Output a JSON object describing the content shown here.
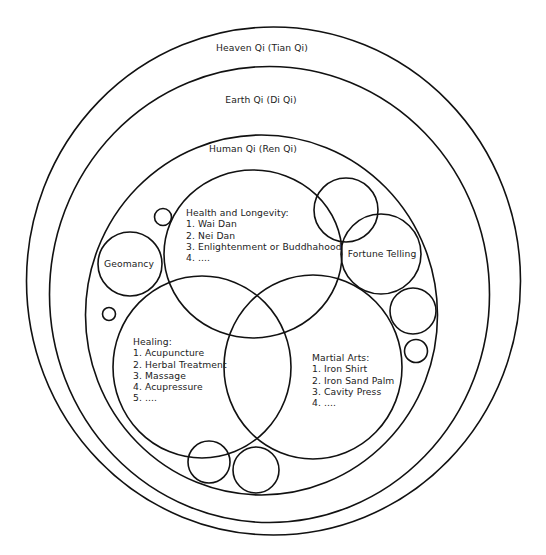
{
  "diagram": {
    "type": "nested-venn",
    "levels": {
      "heaven": "Heaven Qi (Tian Qi)",
      "earth": "Earth Qi (Di Qi)",
      "human": "Human Qi (Ren Qi)"
    },
    "domains": {
      "health": {
        "title": "Health and Longevity:",
        "items": [
          "1. Wai Dan",
          "2. Nei Dan",
          "3. Enlightenment or Buddhahood",
          "4. ...."
        ]
      },
      "healing": {
        "title": "Healing:",
        "items": [
          "1. Acupuncture",
          "2. Herbal Treatment",
          "3. Massage",
          "4. Acupressure",
          "5. ...."
        ]
      },
      "martial": {
        "title": "Martial Arts:",
        "items": [
          "1. Iron Shirt",
          "2. Iron Sand Palm",
          "3. Cavity Press",
          "4. ...."
        ]
      },
      "fortune": "Fortune Telling",
      "geomancy": "Geomancy"
    },
    "colors": {
      "stroke": "#111111",
      "text": "#222222",
      "background": "#ffffff"
    }
  }
}
